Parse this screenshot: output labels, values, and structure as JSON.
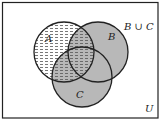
{
  "diagram": {
    "type": "venn",
    "universe_label": "U",
    "highlight_label": "B ∪ C",
    "sets": [
      {
        "name": "A",
        "label": "A"
      },
      {
        "name": "B",
        "label": "B"
      },
      {
        "name": "C",
        "label": "C"
      }
    ],
    "shading": {
      "A": "dashed-pattern",
      "B_union_C": "gray",
      "A_intersect_B_union_C": "gray-with-dashed-pattern"
    },
    "colors": {
      "gray_fill": "#b8b8b8",
      "outline": "#222222",
      "background": "#ffffff"
    }
  }
}
